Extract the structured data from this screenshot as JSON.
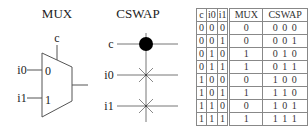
{
  "mux": {
    "title": "MUX",
    "control_label": "c",
    "input0_label": "i0",
    "input1_label": "i1",
    "port0_label": "0",
    "port1_label": "1"
  },
  "cswap": {
    "title": "CSWAP",
    "control_label": "c",
    "wire1_label": "i0",
    "wire2_label": "i1"
  },
  "truth_table": {
    "headers": [
      "c",
      "i0",
      "i1",
      "MUX",
      "CSWAP"
    ],
    "rows": [
      [
        "0",
        "0",
        "0",
        "0",
        "0 0 0"
      ],
      [
        "0",
        "0",
        "1",
        "0",
        "0 0 1"
      ],
      [
        "0",
        "1",
        "0",
        "1",
        "0 1 0"
      ],
      [
        "0",
        "1",
        "1",
        "1",
        "0 1 1"
      ],
      [
        "1",
        "0",
        "0",
        "0",
        "1 0 0"
      ],
      [
        "1",
        "0",
        "1",
        "1",
        "1 1 0"
      ],
      [
        "1",
        "1",
        "0",
        "0",
        "1 0 1"
      ],
      [
        "1",
        "1",
        "1",
        "1",
        "1 1 1"
      ]
    ]
  },
  "colors": {
    "line": "#555555",
    "text": "#222222",
    "control_dot": "#000000",
    "table_border": "#888888"
  }
}
